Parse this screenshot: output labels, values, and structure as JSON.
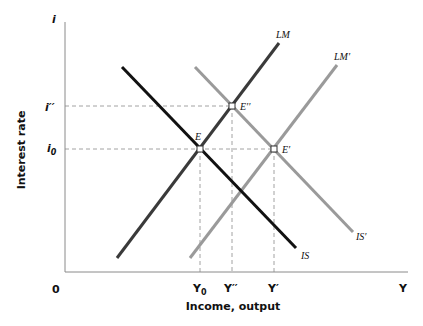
{
  "diagram": {
    "type": "IS-LM",
    "y_axis": {
      "symbol": "i",
      "title": "Interest rate"
    },
    "x_axis": {
      "symbol": "Y",
      "title": "Income, output",
      "origin": "0"
    },
    "y_ticks": [
      {
        "label": "i''",
        "display": "i′′"
      },
      {
        "label": "i0",
        "base": "i",
        "sub": "0"
      }
    ],
    "x_ticks": [
      {
        "label": "Y0",
        "base": "Y",
        "sub": "0"
      },
      {
        "label": "Y''",
        "display": "Y′′"
      },
      {
        "label": "Y'",
        "display": "Y′"
      }
    ],
    "curves": [
      {
        "name": "IS",
        "label": "IS",
        "color": "#111111"
      },
      {
        "name": "LM",
        "label": "LM",
        "color": "#3a3a3a"
      },
      {
        "name": "IS'",
        "label": "IS′",
        "color": "#9a9a9a"
      },
      {
        "name": "LM'",
        "label": "LM′",
        "color": "#9a9a9a"
      }
    ],
    "points": [
      {
        "label": "E"
      },
      {
        "label": "E''",
        "display": "E′′"
      },
      {
        "label": "E'",
        "display": "E′"
      }
    ]
  }
}
